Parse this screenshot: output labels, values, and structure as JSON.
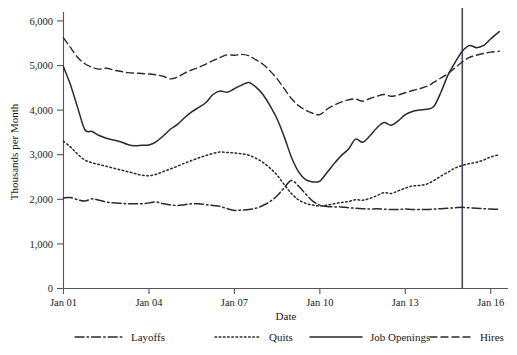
{
  "chart_data": {
    "type": "line",
    "title": "",
    "xlabel": "Date",
    "ylabel": "Thousands per Month",
    "xlim": [
      2001.0,
      2016.5
    ],
    "ylim": [
      0,
      6200
    ],
    "yticks": [
      0,
      1000,
      2000,
      3000,
      4000,
      5000,
      6000
    ],
    "ytick_labels": [
      "0",
      "1,000",
      "2,000",
      "3,000",
      "4,000",
      "5,000",
      "6,000"
    ],
    "xticks": [
      2001,
      2004,
      2007,
      2010,
      2013,
      2016
    ],
    "xtick_labels": [
      "Jan 01",
      "Jan 04",
      "Jan 07",
      "Jan 10",
      "Jan 13",
      "Jan 16"
    ],
    "grid": false,
    "legend_position": "bottom",
    "annotations": [
      {
        "name": "vertical-reference-line",
        "type": "vline",
        "x": 2015.0
      }
    ],
    "x": [
      2001.0,
      2001.25,
      2001.5,
      2001.75,
      2002.0,
      2002.25,
      2002.5,
      2002.75,
      2003.0,
      2003.25,
      2003.5,
      2003.75,
      2004.0,
      2004.25,
      2004.5,
      2004.75,
      2005.0,
      2005.25,
      2005.5,
      2005.75,
      2006.0,
      2006.25,
      2006.5,
      2006.75,
      2007.0,
      2007.25,
      2007.5,
      2007.75,
      2008.0,
      2008.25,
      2008.5,
      2008.75,
      2009.0,
      2009.25,
      2009.5,
      2009.75,
      2010.0,
      2010.25,
      2010.5,
      2010.75,
      2011.0,
      2011.25,
      2011.5,
      2011.75,
      2012.0,
      2012.25,
      2012.5,
      2012.75,
      2013.0,
      2013.25,
      2013.5,
      2013.75,
      2014.0,
      2014.25,
      2014.5,
      2014.75,
      2015.0,
      2015.25,
      2015.5,
      2015.75,
      2016.0,
      2016.3
    ],
    "series": [
      {
        "name": "Job Openings",
        "style": "solid",
        "values": [
          4970,
          4560,
          4050,
          3560,
          3520,
          3430,
          3370,
          3330,
          3290,
          3230,
          3200,
          3210,
          3220,
          3290,
          3420,
          3570,
          3680,
          3830,
          3960,
          4060,
          4170,
          4350,
          4430,
          4400,
          4480,
          4560,
          4620,
          4520,
          4350,
          4100,
          3800,
          3400,
          2950,
          2620,
          2440,
          2390,
          2410,
          2600,
          2800,
          2980,
          3120,
          3350,
          3280,
          3420,
          3600,
          3720,
          3660,
          3760,
          3900,
          3970,
          4000,
          4020,
          4080,
          4400,
          4790,
          5070,
          5320,
          5450,
          5400,
          5450,
          5600,
          5760
        ]
      },
      {
        "name": "Hires",
        "style": "dashed",
        "values": [
          5620,
          5400,
          5180,
          5040,
          4960,
          4920,
          4940,
          4900,
          4870,
          4840,
          4830,
          4820,
          4810,
          4790,
          4760,
          4700,
          4740,
          4830,
          4900,
          4960,
          5030,
          5110,
          5180,
          5240,
          5230,
          5250,
          5220,
          5130,
          5030,
          4880,
          4700,
          4480,
          4260,
          4100,
          4000,
          3930,
          3900,
          4020,
          4110,
          4180,
          4230,
          4250,
          4200,
          4260,
          4310,
          4350,
          4310,
          4340,
          4390,
          4440,
          4480,
          4530,
          4620,
          4720,
          4820,
          4950,
          5080,
          5180,
          5230,
          5270,
          5300,
          5320
        ]
      },
      {
        "name": "Quits",
        "style": "dotted",
        "values": [
          3300,
          3170,
          3010,
          2880,
          2820,
          2780,
          2740,
          2700,
          2660,
          2620,
          2580,
          2540,
          2530,
          2560,
          2620,
          2680,
          2740,
          2810,
          2870,
          2930,
          2980,
          3030,
          3060,
          3050,
          3040,
          3020,
          2990,
          2920,
          2830,
          2700,
          2540,
          2330,
          2130,
          1990,
          1910,
          1870,
          1850,
          1870,
          1900,
          1930,
          1950,
          1990,
          1980,
          2020,
          2080,
          2150,
          2130,
          2190,
          2250,
          2300,
          2310,
          2340,
          2420,
          2520,
          2610,
          2700,
          2760,
          2800,
          2830,
          2880,
          2950,
          3000
        ]
      },
      {
        "name": "Layoffs",
        "style": "dashdot",
        "values": [
          2030,
          2040,
          1990,
          1960,
          2010,
          1980,
          1940,
          1920,
          1910,
          1900,
          1900,
          1900,
          1920,
          1940,
          1900,
          1880,
          1860,
          1880,
          1900,
          1900,
          1880,
          1860,
          1840,
          1790,
          1750,
          1760,
          1770,
          1800,
          1860,
          1950,
          2080,
          2260,
          2420,
          2300,
          2120,
          1960,
          1870,
          1840,
          1830,
          1830,
          1810,
          1800,
          1790,
          1780,
          1790,
          1780,
          1770,
          1770,
          1780,
          1770,
          1770,
          1770,
          1780,
          1790,
          1800,
          1810,
          1820,
          1810,
          1800,
          1790,
          1780,
          1780
        ]
      }
    ]
  },
  "legend": {
    "items": [
      {
        "label": "Layoffs",
        "style": "dashdot"
      },
      {
        "label": "Quits",
        "style": "dotted"
      },
      {
        "label": "Job Openings",
        "style": "solid"
      },
      {
        "label": "Hires",
        "style": "dashed"
      }
    ]
  },
  "colors": {
    "line": "#2a2a2a",
    "axis": "#555555",
    "reference_line": "#4a4a55",
    "background": "#ffffff"
  }
}
